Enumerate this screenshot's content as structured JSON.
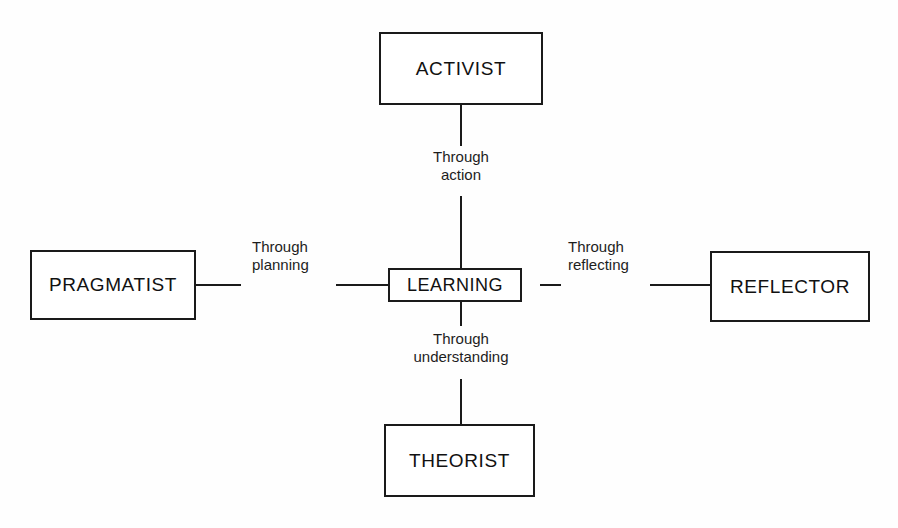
{
  "diagram": {
    "stroke_color": "#1a1a1a",
    "background_color": "#fefefe",
    "nodes": {
      "center": {
        "label": "LEARNING"
      },
      "top": {
        "label": "ACTIVIST"
      },
      "left": {
        "label": "PRAGMATIST"
      },
      "right": {
        "label": "REFLECTOR"
      },
      "bottom": {
        "label": "THEORIST"
      }
    },
    "edge_labels": {
      "top": {
        "line1": "Through",
        "line2": "action"
      },
      "left": {
        "line1": "Through",
        "line2": "planning"
      },
      "right": {
        "line1": "Through",
        "line2": "reflecting"
      },
      "bottom": {
        "line1": "Through",
        "line2": "understanding"
      }
    }
  }
}
